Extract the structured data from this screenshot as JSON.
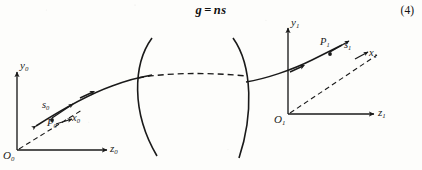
{
  "figure": {
    "equation": {
      "lhs": "g",
      "operator": "=",
      "rhs": "ns",
      "number": "(4)"
    },
    "ink_color": "#1a1a1a",
    "background_color": "#fdfdfb",
    "left_frame": {
      "origin_label": "O",
      "origin_sub": "0",
      "vertical_axis_label": "y",
      "vertical_axis_sub": "0",
      "horizontal_axis_label": "z",
      "horizontal_axis_sub": "0",
      "point_label": "P",
      "point_sub": "0",
      "ray_vector_label": "s",
      "ray_vector_sub": "0",
      "transverse_axis_label": "x",
      "transverse_axis_sub": "0"
    },
    "right_frame": {
      "origin_label": "O",
      "origin_sub": "1",
      "vertical_axis_label": "y",
      "vertical_axis_sub": "1",
      "horizontal_axis_label": "z",
      "horizontal_axis_sub": "1",
      "point_label": "P",
      "point_sub": "1",
      "ray_vector_label": "s",
      "ray_vector_sub": "1",
      "transverse_axis_label": "x",
      "transverse_axis_sub": "1"
    },
    "optical_element": {
      "name": "biconvex-lens",
      "surfaces": 2
    }
  }
}
